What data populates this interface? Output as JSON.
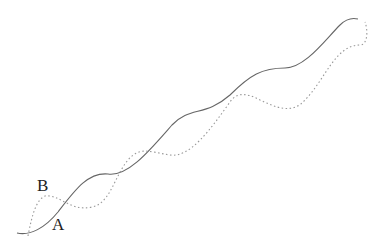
{
  "diagram": {
    "labels": [
      {
        "id": "A",
        "text": "A",
        "x": 52,
        "y": 216
      },
      {
        "id": "B",
        "text": "B",
        "x": 37,
        "y": 177
      }
    ],
    "curves": [
      {
        "name": "curve-a-solid",
        "style": "solid",
        "color": "#666666",
        "path": "M17,233 C30,236 45,228 58,212 C75,190 88,172 108,174 C128,177 150,150 172,125 C190,106 205,117 230,95 C250,75 262,68 285,68 C305,68 325,40 340,25 C348,17 354,18 358,19"
      },
      {
        "name": "curve-b-dotted",
        "style": "dotted",
        "color": "#999999",
        "path": "M28,236 C32,215 36,200 45,196 C60,194 70,212 92,207 C110,204 115,175 128,160 C140,146 150,152 170,155 C190,158 210,130 230,102 C236,93 245,92 260,100 C275,107 292,115 305,100 C325,80 335,45 360,45 C368,45 368,30 365,22"
      }
    ]
  }
}
